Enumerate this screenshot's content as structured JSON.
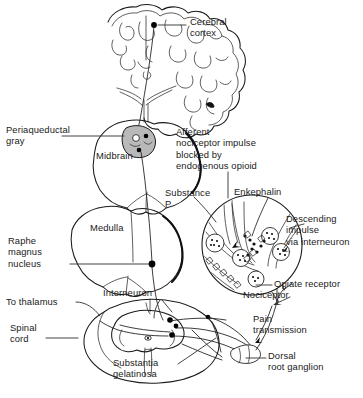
{
  "figure": {
    "width": 363,
    "height": 398,
    "background_color": "#ffffff",
    "line_color": "#1a1a1a",
    "shading_color": "#b9b9b9"
  },
  "labels": {
    "cerebral_cortex": "Cerebral\ncortex",
    "periaqueductal_gray": "Periaqueductal\ngray",
    "midbrain": "Midbrain",
    "medulla": "Medulla",
    "raphe_magnus_nucleus": "Raphe\nmagnus\nnucleus",
    "to_thalamus": "To thalamus",
    "spinal_cord": "Spinal\ncord",
    "interneuron": "Interneuron",
    "substantia_gelatinosa": "Substantia\ngelatinosa",
    "afferent_block": "Afferent\nnociceptor impulse\nblocked by\nendogenous opioid",
    "substance_p": "Substance\nP",
    "enkephalin": "Enkephalin",
    "descending_impulse": "Descending\nimpulse\nvia interneuron",
    "opiate_receptor": "Opiate receptor",
    "nociceptor": "Nociceptor",
    "pain_transmission": "Pain\ntransmission",
    "dorsal_root_ganglion": "Dorsal\nroot ganglion"
  },
  "structures": [
    {
      "name": "cerebral-cortex",
      "type": "brain-sagittal-section",
      "label_key": "cerebral_cortex"
    },
    {
      "name": "periaqueductal-gray",
      "type": "shaded-nucleus",
      "label_key": "periaqueductal_gray",
      "shaded": true
    },
    {
      "name": "midbrain",
      "type": "brainstem-segment",
      "label_key": "midbrain"
    },
    {
      "name": "medulla",
      "type": "brainstem-segment",
      "label_key": "medulla"
    },
    {
      "name": "raphe-magnus-nucleus",
      "type": "nucleus-node",
      "label_key": "raphe_magnus_nucleus"
    },
    {
      "name": "spinal-cord",
      "type": "spinal-cord-cross-section",
      "label_key": "spinal_cord"
    },
    {
      "name": "substantia-gelatinosa",
      "type": "dorsal-horn-region",
      "label_key": "substantia_gelatinosa"
    },
    {
      "name": "dorsal-root-ganglion",
      "type": "ganglion",
      "label_key": "dorsal_root_ganglion"
    },
    {
      "name": "nociceptor",
      "type": "free-nerve-ending",
      "label_key": "nociceptor"
    },
    {
      "name": "synapse-inset",
      "type": "magnified-circle-inset",
      "label_key": "enkephalin"
    }
  ],
  "pathways": [
    {
      "name": "ascending-pain-tract",
      "from": "spinal-cord",
      "to": "cerebral-cortex",
      "label_key": "to_thalamus"
    },
    {
      "name": "descending-inhibitory-tract",
      "from": "periaqueductal-gray",
      "to": "spinal-cord",
      "label_key": "descending_impulse"
    },
    {
      "name": "afferent-nociceptor-input",
      "from": "nociceptor",
      "to": "substantia_gelatinosa",
      "label_key": "pain_transmission"
    }
  ]
}
